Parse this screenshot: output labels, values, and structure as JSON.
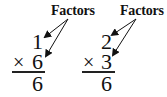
{
  "problems": [
    {
      "label": "Factors",
      "factor_top": "1",
      "operator": "×",
      "factor_bottom": "6",
      "product": "6"
    },
    {
      "label": "Factors",
      "factor_top": "2",
      "operator": "×",
      "factor_bottom": "3",
      "product": "6"
    }
  ],
  "colors": {
    "ink": "#111111",
    "background": "#ffffff"
  }
}
